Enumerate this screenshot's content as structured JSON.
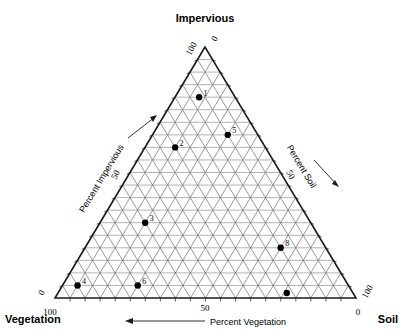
{
  "chart_data": {
    "type": "scatter",
    "plot_kind": "ternary",
    "title": "",
    "vertices": [
      {
        "name": "Impervious",
        "label": "Impervious",
        "position": "top"
      },
      {
        "name": "Vegetation",
        "label": "Vegetation",
        "position": "bottom-left"
      },
      {
        "name": "Soil",
        "label": "Soil",
        "position": "bottom-right"
      }
    ],
    "axes": [
      {
        "id": "left",
        "label": "Percent Impervious",
        "ticks": [
          "0",
          "50",
          "100"
        ],
        "mid_tick": "50",
        "arrow": "up-right"
      },
      {
        "id": "right",
        "label": "Percent Soil",
        "ticks": [
          "0",
          "50",
          "100"
        ],
        "mid_tick": "50",
        "arrow": "down-right"
      },
      {
        "id": "bottom",
        "label": "Percent Vegetation",
        "ticks": [
          "0",
          "50",
          "100"
        ],
        "mid_tick": "50",
        "arrow": "left"
      }
    ],
    "corner_ticks": {
      "apex_left": "100",
      "apex_right": "0",
      "bottom_left_upper": "0",
      "bottom_left_lower": "100",
      "bottom_right_upper": "100",
      "bottom_right_lower": "0"
    },
    "grid": true,
    "grid_divisions": 20,
    "axis_range": [
      0,
      100
    ],
    "series": [
      {
        "name": "samples",
        "marker": "filled-circle",
        "color": "#000000",
        "points": [
          {
            "label": "1",
            "impervious": 80,
            "vegetation": 12,
            "soil": 8
          },
          {
            "label": "2",
            "impervious": 60,
            "vegetation": 30,
            "soil": 10
          },
          {
            "label": "5",
            "impervious": 65,
            "vegetation": 10,
            "soil": 25
          },
          {
            "label": "3",
            "impervious": 30,
            "vegetation": 55,
            "soil": 15
          },
          {
            "label": "8",
            "impervious": 20,
            "vegetation": 15,
            "soil": 65
          },
          {
            "label": "4",
            "impervious": 5,
            "vegetation": 90,
            "soil": 5
          },
          {
            "label": "6",
            "impervious": 5,
            "vegetation": 70,
            "soil": 25
          },
          {
            "label": "",
            "impervious": 2,
            "vegetation": 22,
            "soil": 76
          }
        ]
      }
    ],
    "xlabel": "Percent Vegetation",
    "ylabel": "Percent Impervious",
    "zlabel": "Percent Soil"
  },
  "labels": {
    "top_vertex": "Impervious",
    "left_vertex": "Vegetation",
    "right_vertex": "Soil",
    "left_axis": "Percent Impervious",
    "right_axis": "Percent Soil",
    "bottom_axis": "Percent Vegetation",
    "t0": "0",
    "t50": "50",
    "t100": "100"
  },
  "colors": {
    "line": "#1a1a1a",
    "grid_dark": "#555555",
    "grid_light": "#999999",
    "point": "#000000",
    "background": "#ffffff"
  }
}
